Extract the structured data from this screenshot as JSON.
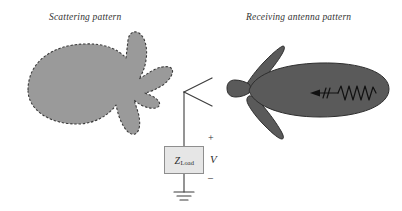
{
  "figure": {
    "background_color": "#ffffff",
    "labels": {
      "scattering_title": "Scattering pattern",
      "receiving_title": "Receiving antenna pattern"
    }
  },
  "scattering_pattern": {
    "name": "Scattering pattern",
    "fill_color": "#9a9a9a",
    "outline_style": "dashed",
    "outline_color": "#3a3a3a"
  },
  "receiving_pattern": {
    "name": "Receiving antenna pattern",
    "fill_color": "#5a5a5a",
    "outline_style": "solid",
    "outline_color": "#2e2e2e"
  },
  "incident_wave": {
    "name": "incident-wave",
    "direction": "leftward",
    "color": "#111111"
  },
  "circuit": {
    "antenna": {
      "type": "v-dipole",
      "color": "#3c3c3c"
    },
    "load": {
      "label_symbol": "Z",
      "label_subscript": "Load",
      "fill_color": "#e6e6e6",
      "border_color": "#8e8e8e"
    },
    "voltage": {
      "plus": "+",
      "symbol": "V",
      "minus": "–"
    },
    "ground": {
      "name": "ground-symbol",
      "color": "#3c3c3c"
    }
  }
}
